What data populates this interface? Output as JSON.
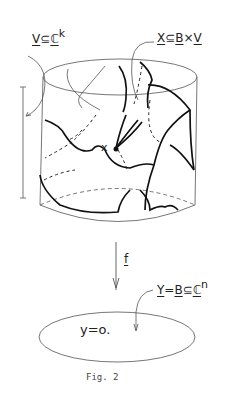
{
  "figure": {
    "caption": "Fig. 2",
    "labels": {
      "v_space": {
        "base": "V",
        "rel": "⊆",
        "field": "ℂ",
        "exp": "k"
      },
      "x_space": {
        "base": "X",
        "rel": "⊆",
        "b": "B",
        "times": "×",
        "v": "V"
      },
      "point": "x",
      "map": "f",
      "y_space": {
        "base": "Y",
        "eq": "=",
        "b": "B",
        "rel": "⊆",
        "field": "ℂ",
        "exp": "n"
      },
      "equation": "y=o."
    },
    "colors": {
      "ink": "#222222",
      "thin_ink": "#666666",
      "background": "#ffffff"
    }
  }
}
